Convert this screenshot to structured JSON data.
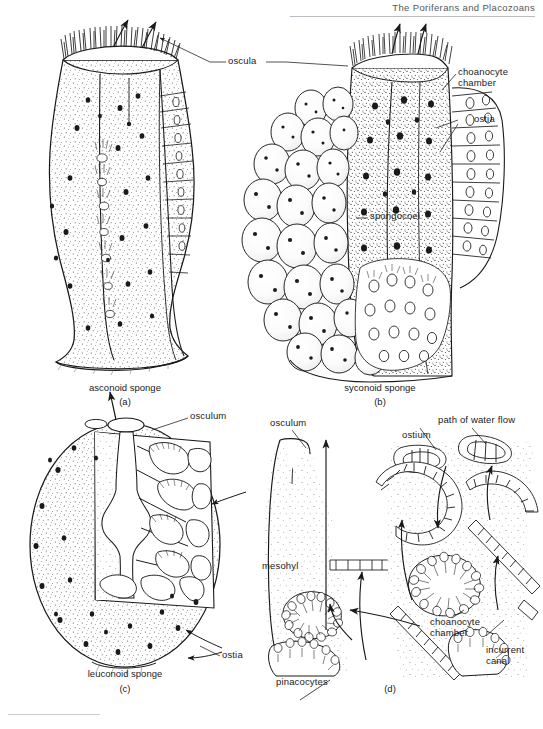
{
  "page": {
    "running_head": "The Poriferans and Placozoans",
    "width": 543,
    "height": 729,
    "ink_color": "#1a1a1a",
    "paper_color": "#ffffff",
    "head_rule_color": "#b9bcc2"
  },
  "panels": [
    {
      "id": "a",
      "id_label": "(a)",
      "caption": "asconoid sponge",
      "type": "asconoid",
      "labels": [
        "oscula"
      ]
    },
    {
      "id": "b",
      "id_label": "(b)",
      "caption": "syconoid sponge",
      "type": "syconoid",
      "labels": [
        "oscula",
        "choanocyte chamber",
        "ostia",
        "spongocoel"
      ]
    },
    {
      "id": "c",
      "id_label": "(c)",
      "caption": "leuconoid sponge",
      "type": "leuconoid",
      "labels": [
        "osculum",
        "ostia"
      ]
    },
    {
      "id": "d",
      "id_label": "(d)",
      "caption": "",
      "type": "cellular-detail",
      "labels": [
        "osculum",
        "ostium",
        "path of water flow",
        "mesohyl",
        "pinacocytes",
        "choanocyte chamber",
        "incurrent canal"
      ]
    }
  ],
  "labels": {
    "oscula": "oscula",
    "choanocyte_chamber_top": "choanocyte",
    "choanocyte_chamber_top2": "chamber",
    "ostia_top": "ostia",
    "spongocoel": "spongocoel",
    "osculum_c": "osculum",
    "ostia_c": "ostia",
    "osculum_d": "osculum",
    "ostium_d": "ostium",
    "path_of_water_flow": "path of water flow",
    "mesohyl": "mesohyl",
    "pinacocytes": "pinacocytes",
    "choanocyte_chamber_d": "choanocyte",
    "choanocyte_chamber_d2": "chamber",
    "incurrent_canal": "incurrent",
    "incurrent_canal2": "canal"
  },
  "captions": {
    "a": "asconoid sponge",
    "b": "syconoid sponge",
    "c": "leuconoid sponge",
    "a_id": "(a)",
    "b_id": "(b)",
    "c_id": "(c)",
    "d_id": "(d)"
  }
}
